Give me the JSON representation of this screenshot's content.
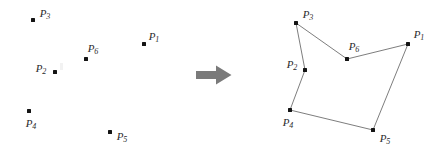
{
  "figure": {
    "background_color": "#ffffff",
    "dot_color": "#141414",
    "edge_color": "#6e6e6e",
    "label_color": "#2b2b2b",
    "arrow_color": "#7a7a7a"
  },
  "left_panel": {
    "name": "unordered point set",
    "points": [
      {
        "id": "P1",
        "base": "P",
        "sub": "1",
        "x": 144,
        "y": 44,
        "label_x": 154,
        "label_y": 36
      },
      {
        "id": "P2",
        "base": "P",
        "sub": "2",
        "x": 55,
        "y": 72,
        "label_x": 41,
        "label_y": 68
      },
      {
        "id": "P3",
        "base": "P",
        "sub": "3",
        "x": 33,
        "y": 20,
        "label_x": 45,
        "label_y": 13
      },
      {
        "id": "P4",
        "base": "P",
        "sub": "4",
        "x": 29,
        "y": 111,
        "label_x": 31,
        "label_y": 123
      },
      {
        "id": "P5",
        "base": "P",
        "sub": "5",
        "x": 110,
        "y": 132,
        "label_x": 122,
        "label_y": 136
      },
      {
        "id": "P6",
        "base": "P",
        "sub": "6",
        "x": 86,
        "y": 59,
        "label_x": 93,
        "label_y": 48
      }
    ]
  },
  "arrow": {
    "name": "transformation arrow",
    "direction": "right",
    "color": "#7a7a7a"
  },
  "right_panel": {
    "name": "simple polygon",
    "points": [
      {
        "id": "P1",
        "base": "P",
        "sub": "1",
        "x": 153,
        "y": 44,
        "label_x": 164,
        "label_y": 34
      },
      {
        "id": "P2",
        "base": "P",
        "sub": "2",
        "x": 50,
        "y": 70,
        "label_x": 37,
        "label_y": 64
      },
      {
        "id": "P3",
        "base": "P",
        "sub": "3",
        "x": 41,
        "y": 23,
        "label_x": 53,
        "label_y": 14
      },
      {
        "id": "P4",
        "base": "P",
        "sub": "4",
        "x": 35,
        "y": 110,
        "label_x": 33,
        "label_y": 122
      },
      {
        "id": "P5",
        "base": "P",
        "sub": "5",
        "x": 118,
        "y": 130,
        "label_x": 130,
        "label_y": 138
      },
      {
        "id": "P6",
        "base": "P",
        "sub": "6",
        "x": 92,
        "y": 59,
        "label_x": 99,
        "label_y": 46
      }
    ],
    "polygon_order": [
      "P3",
      "P6",
      "P1",
      "P5",
      "P4",
      "P2"
    ],
    "polygon_points": "41,23 92,59 153,44 118,130 35,110 50,70"
  }
}
